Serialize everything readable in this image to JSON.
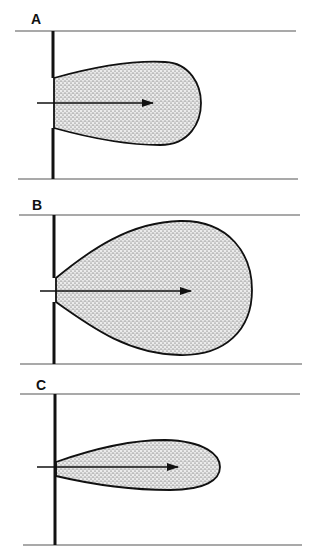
{
  "figure": {
    "panels": [
      {
        "label": "A",
        "label_pos": [
          31,
          12
        ],
        "top_line": {
          "x1": 15,
          "x2": 296,
          "y": 31
        },
        "bottom_line": {
          "x1": 18,
          "x2": 298,
          "y": 179
        },
        "wall": {
          "x": 53,
          "upper": [
            31,
            78
          ],
          "lower": [
            128,
            179
          ]
        },
        "lobe_path": "M54,78 C90,68 130,60 165,62 C190,63 201,85 201,103 C201,122 190,145 160,145 C125,145 90,138 54,128 Z",
        "arrow": {
          "x1": 37,
          "x2": 153,
          "y": 103
        }
      },
      {
        "label": "B",
        "label_pos": [
          32,
          199
        ],
        "top_line": {
          "x1": 19,
          "x2": 300,
          "y": 215
        },
        "bottom_line": {
          "x1": 20,
          "x2": 302,
          "y": 364
        },
        "wall": {
          "x": 54,
          "upper": [
            215,
            278
          ],
          "lower": [
            302,
            364
          ]
        },
        "lobe_path": "M56,278 C90,250 130,222 180,221 C230,220 252,255 252,290 C252,330 225,356 180,355 C130,354 95,330 56,302 Z",
        "arrow": {
          "x1": 40,
          "x2": 191,
          "y": 291
        }
      },
      {
        "label": "C",
        "label_pos": [
          36,
          379
        ],
        "top_line": {
          "x1": 20,
          "x2": 300,
          "y": 394
        },
        "bottom_line": {
          "x1": 23,
          "x2": 302,
          "y": 545
        },
        "wall": {
          "x": 55,
          "upper": [
            394,
            463
          ],
          "lower": [
            463,
            545
          ]
        },
        "lobe_path": "M56,462 C90,450 130,440 165,440 C205,441 220,455 220,467 C220,480 205,490 170,490 C130,490 90,484 56,476 Z",
        "arrow": {
          "x1": 37,
          "x2": 178,
          "y": 467
        }
      }
    ],
    "colors": {
      "stroke": "#111111",
      "line": "#555555",
      "stipple": "#333333",
      "fill_bg": "#e6e6e6"
    }
  }
}
